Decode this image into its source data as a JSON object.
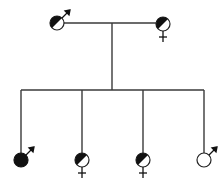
{
  "diagram": {
    "type": "pedigree",
    "colors": {
      "line": "#3a3a3a",
      "fill": "#111111",
      "background": "#ffffff"
    },
    "parents": [
      {
        "id": "father",
        "sex": "male",
        "symbol": "♂",
        "status": "carrier (half-filled)"
      },
      {
        "id": "mother",
        "sex": "female",
        "symbol": "♀",
        "status": "carrier (half-filled)"
      }
    ],
    "children": [
      {
        "id": "child-1",
        "sex": "male",
        "symbol": "♂",
        "status": "affected (filled)"
      },
      {
        "id": "child-2",
        "sex": "female",
        "symbol": "♀",
        "status": "carrier (half-filled)"
      },
      {
        "id": "child-3",
        "sex": "female",
        "symbol": "♀",
        "status": "carrier (half-filled)"
      },
      {
        "id": "child-4",
        "sex": "male",
        "symbol": "♂",
        "status": "unaffected (empty)"
      }
    ]
  }
}
